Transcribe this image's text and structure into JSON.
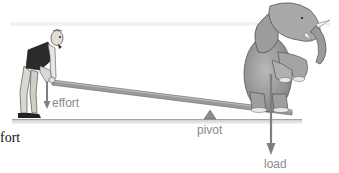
{
  "diagram": {
    "type": "lever-illustration",
    "labels": {
      "effort": "effort",
      "pivot": "pivot",
      "load": "load",
      "cropped_caption": "fort"
    },
    "figures": [
      "man-pushing-down",
      "elephant-sitting"
    ],
    "colors": {
      "arrow": "#7f7f7f",
      "label": "#8a8a8a",
      "plank": "#8e8e8e",
      "ground": "#b8b8b8",
      "caption": "#111111"
    }
  }
}
